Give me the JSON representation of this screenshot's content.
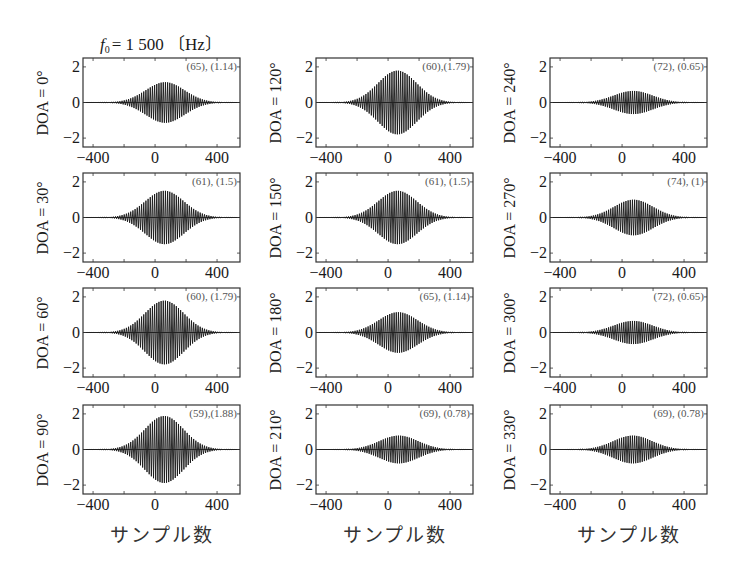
{
  "figure": {
    "title": {
      "symbol": "f",
      "subscript": "0",
      "text": "= 1 500 〔Hz〕"
    },
    "xlabel": "サンプル数",
    "ytick_labels": [
      "2",
      "0",
      "−2"
    ],
    "xtick_labels": [
      "−400",
      "0",
      "400"
    ]
  },
  "chart_data": {
    "type": "line",
    "xlabel": "サンプル数",
    "ylabel": "DOA",
    "xlim": [
      -465,
      548
    ],
    "ylim": [
      -2.5,
      2.5
    ],
    "xticks": [
      -400,
      0,
      400
    ],
    "yticks": [
      -2,
      0,
      2
    ],
    "grid": false,
    "layout": {
      "rows": 4,
      "cols": 3
    },
    "panels": [
      {
        "col": 0,
        "row": 0,
        "doa": 0,
        "label": "DOA = 0°",
        "peak_sample": 65,
        "peak_amplitude": 1.14,
        "annotation": "(65), (1.14)"
      },
      {
        "col": 0,
        "row": 1,
        "doa": 30,
        "label": "DOA = 30°",
        "peak_sample": 61,
        "peak_amplitude": 1.5,
        "annotation": "(61), (1.5)"
      },
      {
        "col": 0,
        "row": 2,
        "doa": 60,
        "label": "DOA = 60°",
        "peak_sample": 60,
        "peak_amplitude": 1.79,
        "annotation": "(60), (1.79)"
      },
      {
        "col": 0,
        "row": 3,
        "doa": 90,
        "label": "DOA = 90°",
        "peak_sample": 59,
        "peak_amplitude": 1.88,
        "annotation": "(59),(1.88)"
      },
      {
        "col": 1,
        "row": 0,
        "doa": 120,
        "label": "DOA = 120°",
        "peak_sample": 60,
        "peak_amplitude": 1.79,
        "annotation": "(60),(1.79)"
      },
      {
        "col": 1,
        "row": 1,
        "doa": 150,
        "label": "DOA = 150°",
        "peak_sample": 61,
        "peak_amplitude": 1.5,
        "annotation": "(61), (1.5)"
      },
      {
        "col": 1,
        "row": 2,
        "doa": 180,
        "label": "DOA = 180°",
        "peak_sample": 65,
        "peak_amplitude": 1.14,
        "annotation": "(65), (1.14)"
      },
      {
        "col": 1,
        "row": 3,
        "doa": 210,
        "label": "DOA = 210°",
        "peak_sample": 69,
        "peak_amplitude": 0.78,
        "annotation": "(69), (0.78)"
      },
      {
        "col": 2,
        "row": 0,
        "doa": 240,
        "label": "DOA = 240°",
        "peak_sample": 72,
        "peak_amplitude": 0.65,
        "annotation": "(72), (0.65)"
      },
      {
        "col": 2,
        "row": 1,
        "doa": 270,
        "label": "DOA = 270°",
        "peak_sample": 74,
        "peak_amplitude": 1.0,
        "annotation": "(74), (1)"
      },
      {
        "col": 2,
        "row": 2,
        "doa": 300,
        "label": "DOA = 300°",
        "peak_sample": 72,
        "peak_amplitude": 0.65,
        "annotation": "(72), (0.65)"
      },
      {
        "col": 2,
        "row": 3,
        "doa": 330,
        "label": "DOA = 330°",
        "peak_sample": 69,
        "peak_amplitude": 0.78,
        "annotation": "(69), (0.78)"
      }
    ]
  }
}
